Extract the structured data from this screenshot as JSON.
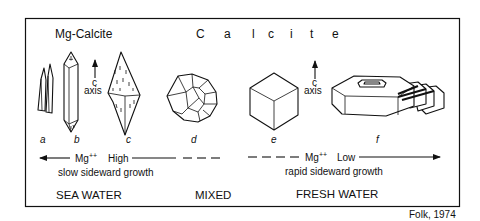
{
  "title_left": "Mg-Calcite",
  "title_right_letters": [
    "C",
    "a",
    "l",
    "c",
    "i",
    "t",
    "e"
  ],
  "axis_labels": {
    "left": {
      "c": "c",
      "axis": "axis"
    },
    "right": {
      "c": "c",
      "axis": "axis"
    }
  },
  "crystals": [
    {
      "id": "a",
      "label": "a"
    },
    {
      "id": "b",
      "label": "b"
    },
    {
      "id": "c",
      "label": "c"
    },
    {
      "id": "d",
      "label": "d"
    },
    {
      "id": "e",
      "label": "e"
    },
    {
      "id": "f",
      "label": "f"
    }
  ],
  "gradient_left": {
    "ion": "Mg",
    "charge": "++",
    "level": "High",
    "growth": "slow sideward growth"
  },
  "gradient_right": {
    "ion": "Mg",
    "charge": "++",
    "level": "Low",
    "growth": "rapid sideward growth"
  },
  "environments": [
    "SEA WATER",
    "MIXED",
    "FRESH WATER"
  ],
  "citation": "Folk, 1974"
}
